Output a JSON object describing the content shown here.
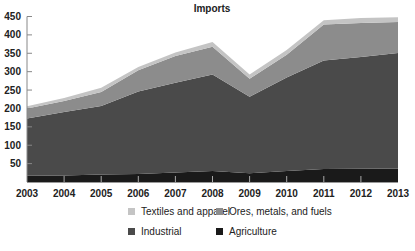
{
  "chart_data": {
    "type": "area",
    "stacked": true,
    "title": "Imports",
    "xlabel": "",
    "ylabel": "",
    "categories": [
      "2003",
      "2004",
      "2005",
      "2006",
      "2007",
      "2008",
      "2009",
      "2010",
      "2011",
      "2012",
      "2013"
    ],
    "yticks": [
      50,
      100,
      150,
      200,
      250,
      300,
      350,
      400,
      450
    ],
    "ylim": [
      0,
      450
    ],
    "grid": false,
    "legend_position": "bottom",
    "series": [
      {
        "name": "Agriculture",
        "color": "#1a1a1a",
        "values": [
          17,
          18,
          20,
          22,
          26,
          30,
          24,
          30,
          35,
          36,
          37
        ]
      },
      {
        "name": "Industrial",
        "color": "#4a4a4a",
        "values": [
          156,
          172,
          187,
          224,
          244,
          262,
          208,
          254,
          295,
          304,
          314
        ]
      },
      {
        "name": "Ores, metals, and fuels",
        "color": "#8c8c8c",
        "values": [
          27,
          30,
          38,
          58,
          73,
          76,
          49,
          62,
          98,
          92,
          84
        ]
      },
      {
        "name": "Textiles and apparel",
        "color": "#c4c4c4",
        "values": [
          6,
          8,
          11,
          9,
          9,
          13,
          11,
          13,
          12,
          14,
          13
        ]
      }
    ]
  },
  "legend": {
    "items": [
      {
        "label": "Textiles and apparel",
        "color": "#c4c4c4"
      },
      {
        "label": "Ores, metals, and fuels",
        "color": "#8c8c8c"
      },
      {
        "label": "Industrial",
        "color": "#4a4a4a"
      },
      {
        "label": "Agriculture",
        "color": "#1a1a1a"
      }
    ]
  }
}
